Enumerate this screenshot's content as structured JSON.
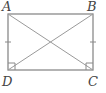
{
  "diagram": {
    "type": "rectangle-with-diagonals",
    "vertices": [
      {
        "label": "A",
        "x": 8,
        "y": 14
      },
      {
        "label": "B",
        "x": 93,
        "y": 14
      },
      {
        "label": "C",
        "x": 93,
        "y": 70
      },
      {
        "label": "D",
        "x": 8,
        "y": 70
      }
    ],
    "labels": {
      "A": "A",
      "B": "B",
      "C": "C",
      "D": "D"
    },
    "diagonals": [
      "AC",
      "BD"
    ],
    "congruence_ticks": [
      "AD",
      "BC"
    ],
    "right_angles": [
      "D",
      "C"
    ],
    "colors": {
      "stroke": "#888888",
      "label": "#444444"
    }
  }
}
